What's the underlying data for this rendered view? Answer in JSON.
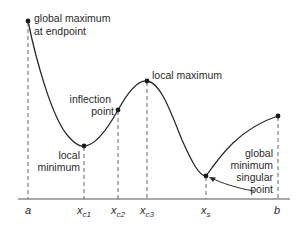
{
  "diagram": {
    "annotations": {
      "global_max_line1": "global maximum",
      "global_max_line2": "at endpoint",
      "inflection_line1": "inflection",
      "inflection_line2": "point",
      "local_max": "local maximum",
      "local_min_line1": "local",
      "local_min_line2": "minimum",
      "global_min_line1": "global",
      "global_min_line2": "minimum",
      "global_min_line3": "singular",
      "global_min_line4": "point"
    },
    "axis_labels": {
      "a": "a",
      "xc1_base": "x",
      "xc1_sub": "c1",
      "xc2_base": "x",
      "xc2_sub": "c2",
      "xc3_base": "x",
      "xc3_sub": "c3",
      "xs_base": "x",
      "xs_sub": "s",
      "b": "b"
    },
    "colors": {
      "curve": "#2b2b2b",
      "dash": "#555555",
      "axis": "#555555"
    }
  }
}
